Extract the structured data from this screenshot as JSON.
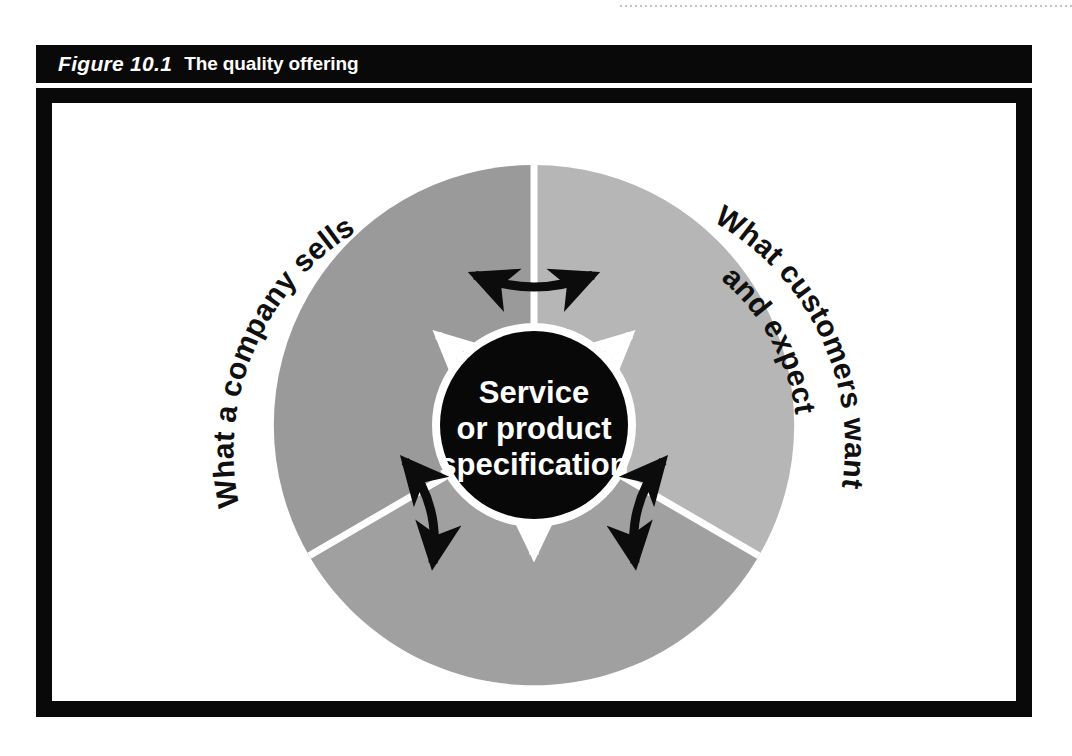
{
  "figure": {
    "number_label": "Figure 10.1",
    "title": "The quality offering"
  },
  "diagram": {
    "center": {
      "line1": "Service",
      "line2": "or product",
      "line3": "specification"
    },
    "segments": [
      {
        "id": "company",
        "label_lines": [
          "What a company sells"
        ],
        "fill": "#9a9a9a"
      },
      {
        "id": "customers",
        "label_lines": [
          "What customers want",
          "and expect"
        ],
        "fill": "#b6b6b6"
      },
      {
        "id": "operations",
        "label_lines": [
          "What operations",
          "needs to provide consistently"
        ],
        "fill": "#a0a0a0"
      }
    ],
    "colors": {
      "center_fill": "#080808",
      "divider": "#ffffff",
      "outward_arrow": "#ffffff",
      "linking_arrow": "#0c0c0c",
      "frame": "#090909",
      "caption_bar": "#090909",
      "page_background": "#ffffff"
    },
    "arrows": {
      "outward_count": 3,
      "linking_count": 3,
      "outward_style": "double-headed white arrow from centre across each boundary",
      "linking_style": "double-headed black curved arrow spanning each segment divider"
    }
  }
}
